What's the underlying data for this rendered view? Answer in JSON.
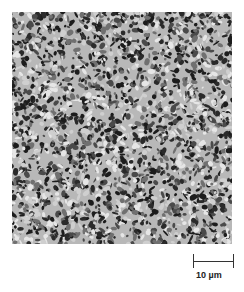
{
  "figure": {
    "type": "micrograph",
    "scale_bar": {
      "label": "10 µm",
      "length_px": 40
    },
    "colors": {
      "dark_phase": "#2a2a2a",
      "mid_phase": "#707070",
      "light_phase": "#e6e6e6",
      "background": "#ffffff"
    }
  }
}
